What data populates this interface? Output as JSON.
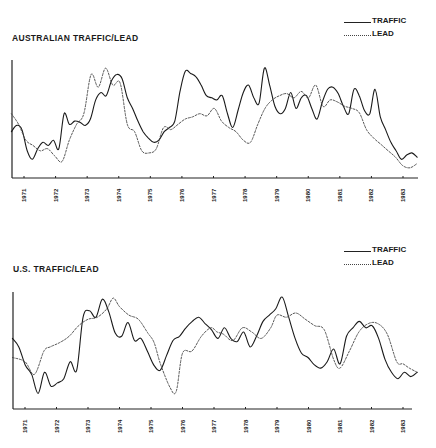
{
  "charts": [
    {
      "title": "AUSTRALIAN TRAFFIC/LEAD",
      "legend": [
        {
          "label": "TRAFFIC",
          "style": "solid"
        },
        {
          "label": "LEAD",
          "style": "dotted"
        }
      ]
    },
    {
      "title": "U.S. TRAFFIC/LEAD",
      "legend": [
        {
          "label": "TRAFFIC",
          "style": "solid"
        },
        {
          "label": "LEAD",
          "style": "dotted"
        }
      ]
    }
  ],
  "chart_data": [
    {
      "type": "line",
      "title": "AUSTRALIAN TRAFFIC/LEAD",
      "xlabel": "",
      "ylabel": "",
      "x_tick_labels": [
        "1971",
        "1972",
        "1973",
        "1974",
        "1975",
        "1976",
        "1977",
        "1978",
        "1979",
        "1980",
        "1981",
        "1982",
        "1983"
      ],
      "x_range": [
        1970.6,
        1983.5
      ],
      "y_range": [
        0,
        100
      ],
      "y_ticks": "none",
      "grid": false,
      "legend_position": "top-right",
      "series": [
        {
          "name": "TRAFFIC",
          "style": "solid",
          "x": [
            1970.6,
            1970.8,
            1971.0,
            1971.2,
            1971.4,
            1971.6,
            1971.8,
            1972.0,
            1972.2,
            1972.35,
            1972.5,
            1972.7,
            1972.9,
            1973.1,
            1973.3,
            1973.5,
            1973.7,
            1973.9,
            1974.1,
            1974.3,
            1974.5,
            1974.7,
            1974.9,
            1975.1,
            1975.3,
            1975.5,
            1975.7,
            1975.9,
            1976.1,
            1976.3,
            1976.5,
            1976.7,
            1976.9,
            1977.1,
            1977.3,
            1977.5,
            1977.7,
            1977.9,
            1978.1,
            1978.3,
            1978.5,
            1978.7,
            1978.9,
            1979.1,
            1979.3,
            1979.5,
            1979.7,
            1979.9,
            1980.1,
            1980.3,
            1980.5,
            1980.7,
            1980.9,
            1981.1,
            1981.3,
            1981.5,
            1981.7,
            1981.9,
            1982.1,
            1982.3,
            1982.5,
            1982.7,
            1982.9,
            1983.1,
            1983.3,
            1983.45
          ],
          "values": [
            38,
            44,
            40,
            20,
            12,
            22,
            28,
            25,
            30,
            22,
            55,
            45,
            48,
            47,
            44,
            50,
            68,
            75,
            72,
            86,
            92,
            88,
            70,
            60,
            48,
            38,
            32,
            28,
            30,
            38,
            42,
            48,
            76,
            95,
            93,
            90,
            82,
            72,
            70,
            68,
            72,
            55,
            42,
            58,
            75,
            82,
            70,
            65,
            98,
            82,
            62,
            55,
            60,
            75,
            60,
            70,
            72,
            60,
            50,
            66,
            78,
            80,
            74,
            62,
            55,
            78,
            72,
            58,
            55,
            78,
            52,
            40,
            28,
            20,
            12,
            16,
            18,
            14
          ],
          "note": "approximate trace; values normalized 0-100 (no y-axis scale shown)"
        },
        {
          "name": "LEAD",
          "style": "dotted",
          "x": [
            1970.6,
            1971.0,
            1971.3,
            1971.6,
            1971.9,
            1972.2,
            1972.5,
            1972.8,
            1973.1,
            1973.4,
            1973.6,
            1973.8,
            1974.0,
            1974.2,
            1974.5,
            1974.8,
            1975.0,
            1975.2,
            1975.4,
            1975.6,
            1975.8,
            1976.0,
            1976.2,
            1976.5,
            1976.8,
            1977.0,
            1977.2,
            1977.4,
            1977.6,
            1977.9,
            1978.2,
            1978.5,
            1978.8,
            1979.0,
            1979.2,
            1979.5,
            1979.8,
            1980.1,
            1980.3,
            1980.5,
            1980.8,
            1981.1,
            1981.4,
            1981.7,
            1982.0,
            1982.2,
            1982.5,
            1982.8,
            1983.0,
            1983.2,
            1983.45
          ],
          "values": [
            55,
            45,
            30,
            25,
            20,
            22,
            15,
            10,
            30,
            45,
            55,
            92,
            80,
            98,
            82,
            84,
            45,
            38,
            20,
            18,
            22,
            42,
            40,
            45,
            50,
            52,
            55,
            53,
            60,
            48,
            42,
            38,
            30,
            28,
            45,
            60,
            68,
            72,
            74,
            70,
            76,
            70,
            82,
            62,
            68,
            66,
            62,
            60,
            56,
            40,
            32,
            26,
            20,
            14,
            6,
            4,
            8
          ],
          "note": "approximate trace; values normalized 0-100"
        }
      ]
    },
    {
      "type": "line",
      "title": "U.S. TRAFFIC/LEAD",
      "xlabel": "",
      "ylabel": "",
      "x_tick_labels": [
        "1971",
        "1972",
        "1973",
        "1974",
        "1975",
        "1976",
        "1977",
        "1978",
        "1979",
        "1980",
        "1981",
        "1982",
        "1983"
      ],
      "x_range": [
        1970.6,
        1983.5
      ],
      "y_range": [
        0,
        100
      ],
      "y_ticks": "none",
      "grid": false,
      "legend_position": "top-right",
      "series": [
        {
          "name": "TRAFFIC",
          "style": "solid",
          "x": [
            1970.6,
            1970.9,
            1971.2,
            1971.4,
            1971.6,
            1971.8,
            1972.0,
            1972.2,
            1972.4,
            1972.6,
            1972.8,
            1973.0,
            1973.2,
            1973.4,
            1973.6,
            1973.8,
            1974.0,
            1974.2,
            1974.4,
            1974.6,
            1974.8,
            1975.0,
            1975.2,
            1975.4,
            1975.6,
            1975.8,
            1976.0,
            1976.2,
            1976.5,
            1976.8,
            1977.0,
            1977.2,
            1977.4,
            1977.6,
            1977.8,
            1978.0,
            1978.2,
            1978.4,
            1978.6,
            1978.8,
            1979.0,
            1979.2,
            1979.4,
            1979.6,
            1979.8,
            1980.0,
            1980.2,
            1980.4,
            1980.6,
            1980.8,
            1981.0,
            1981.2,
            1981.4,
            1981.6,
            1981.8,
            1982.0,
            1982.2,
            1982.4,
            1982.6,
            1982.8,
            1983.0,
            1983.2,
            1983.45
          ],
          "values": [
            60,
            52,
            35,
            26,
            8,
            28,
            15,
            18,
            22,
            38,
            30,
            80,
            86,
            80,
            97,
            85,
            65,
            62,
            75,
            58,
            60,
            48,
            35,
            30,
            44,
            58,
            62,
            70,
            76,
            80,
            74,
            68,
            60,
            70,
            60,
            57,
            66,
            52,
            62,
            76,
            82,
            88,
            99,
            80,
            60,
            46,
            42,
            35,
            32,
            38,
            50,
            36,
            62,
            70,
            76,
            70,
            72,
            60,
            40,
            28,
            22,
            28,
            24,
            28
          ],
          "note": "approximate trace; values normalized 0-100"
        },
        {
          "name": "LEAD",
          "style": "dotted",
          "x": [
            1970.6,
            1971.0,
            1971.3,
            1971.6,
            1971.8,
            1972.1,
            1972.4,
            1972.7,
            1973.0,
            1973.3,
            1973.6,
            1973.8,
            1974.0,
            1974.3,
            1974.6,
            1974.9,
            1975.1,
            1975.3,
            1975.6,
            1975.8,
            1976.0,
            1976.3,
            1976.6,
            1976.9,
            1977.1,
            1977.3,
            1977.6,
            1977.9,
            1978.2,
            1978.5,
            1978.8,
            1979.0,
            1979.3,
            1979.6,
            1979.9,
            1980.2,
            1980.5,
            1980.8,
            1981.0,
            1981.3,
            1981.6,
            1981.9,
            1982.2,
            1982.5,
            1982.8,
            1983.0,
            1983.2,
            1983.45
          ],
          "values": [
            42,
            38,
            26,
            48,
            52,
            56,
            62,
            72,
            78,
            80,
            88,
            98,
            90,
            82,
            78,
            65,
            56,
            36,
            14,
            10,
            46,
            48,
            62,
            70,
            66,
            64,
            58,
            70,
            66,
            60,
            70,
            82,
            80,
            84,
            78,
            72,
            68,
            40,
            32,
            48,
            66,
            74,
            74,
            64,
            38,
            36,
            32,
            28
          ],
          "note": "approximate trace; values normalized 0-100"
        }
      ]
    }
  ]
}
